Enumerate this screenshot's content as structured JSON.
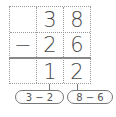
{
  "diagram": {
    "type": "vertical-subtraction",
    "rows": [
      {
        "op": "",
        "tens": "3",
        "ones": "8"
      },
      {
        "op": "−",
        "tens": "2",
        "ones": "6"
      },
      {
        "op": "",
        "tens": "1",
        "ones": "2"
      }
    ],
    "annotations": [
      {
        "label": "3 − 2",
        "column": "tens"
      },
      {
        "label": "8 − 6",
        "column": "ones"
      }
    ],
    "colors": {
      "grid": "#999999",
      "rule": "#888888",
      "text": "#4a4a4a"
    }
  }
}
